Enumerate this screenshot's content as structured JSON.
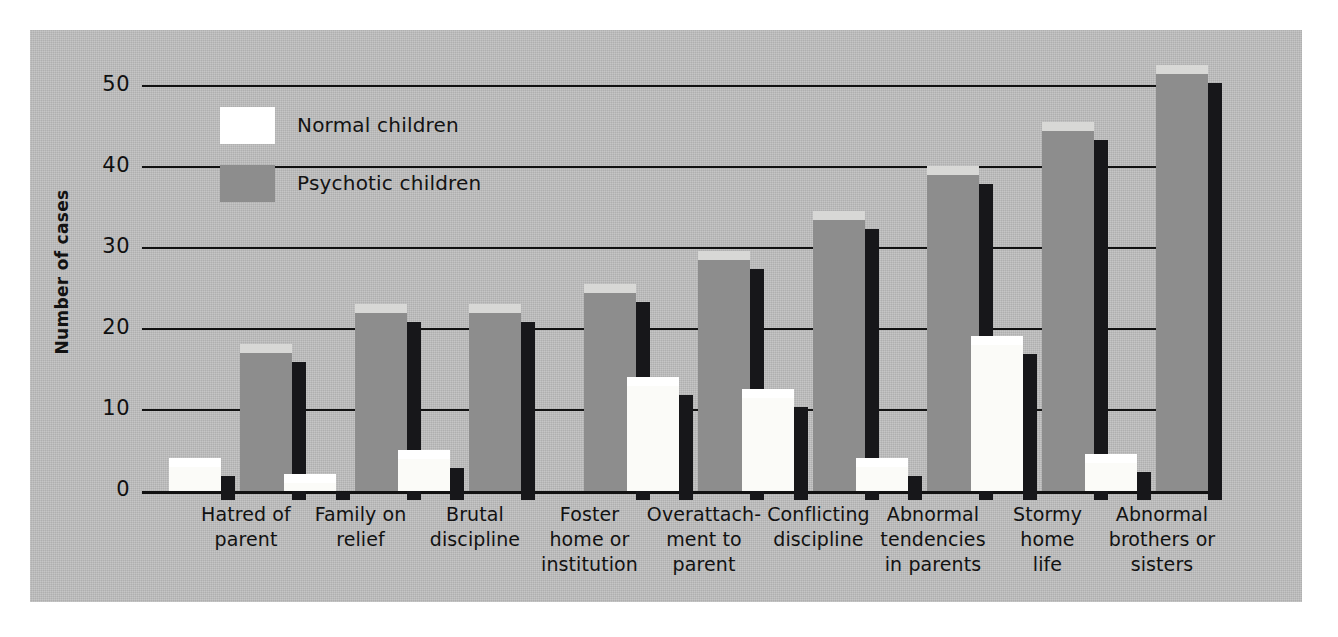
{
  "chart_data": {
    "type": "bar",
    "title": "",
    "xlabel": "",
    "ylabel": "Number of cases",
    "ylim": [
      0,
      52
    ],
    "yticks": [
      0,
      10,
      20,
      30,
      40,
      50
    ],
    "grid": true,
    "legend_position": "upper-left-inside",
    "categories": [
      "Hatred of parent",
      "Family on relief",
      "Brutal discipline",
      "Foster home or institution",
      "Overattachment to parent",
      "Conflicting discipline",
      "Abnormal tendencies in parents",
      "Stormy home life",
      "Abnormal brothers or sisters"
    ],
    "category_lines": [
      [
        "Hatred of",
        "parent"
      ],
      [
        "Family on",
        "relief"
      ],
      [
        "Brutal",
        "discipline"
      ],
      [
        "Foster",
        "home or",
        "institution"
      ],
      [
        "Overattach-",
        "ment to",
        "parent"
      ],
      [
        "Conflicting",
        "discipline"
      ],
      [
        "Abnormal",
        "tendencies",
        "in parents"
      ],
      [
        "Stormy",
        "home",
        "life"
      ],
      [
        "Abnormal",
        "brothers or",
        "sisters"
      ]
    ],
    "series": [
      {
        "name": "Normal children",
        "color": "#ffffff",
        "values": [
          3,
          1,
          4,
          0,
          13,
          11.5,
          3,
          18,
          3.5
        ]
      },
      {
        "name": "Psychotic children",
        "color": "#8d8d8d",
        "values": [
          17,
          22,
          22,
          24.5,
          28.5,
          33.5,
          39,
          44.5,
          51.5
        ]
      }
    ]
  },
  "legend": {
    "entries": [
      {
        "label": "Normal children",
        "swatch": "white"
      },
      {
        "label": "Psychotic children",
        "swatch": "grey"
      }
    ]
  },
  "axes": {
    "y_label": "Number of cases",
    "y_ticks": [
      "0",
      "10",
      "20",
      "30",
      "40",
      "50"
    ]
  },
  "colors": {
    "panel_background": "#bfbfbf",
    "page_background": "#ffffff",
    "normal_bar": "#ffffff",
    "psychotic_bar": "#8d8d8d",
    "bar_shadow": "#17171a",
    "axis_line": "#121212"
  }
}
